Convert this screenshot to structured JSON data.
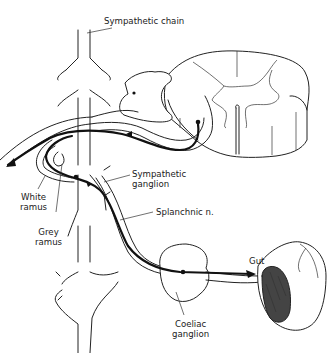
{
  "diagram": {
    "type": "anatomical-illustration",
    "labels": {
      "sympathetic_chain": "Sympathetic chain",
      "sympathetic_ganglion_line1": "Sympathetic",
      "sympathetic_ganglion_line2": "ganglion",
      "white_ramus_line1": "White",
      "white_ramus_line2": "ramus",
      "grey_ramus_line1": "Grey",
      "grey_ramus_line2": "ramus",
      "splanchnic_nerve": "Splanchnic n.",
      "gut": "Gut",
      "coeliac_ganglion_line1": "Coeliac",
      "coeliac_ganglion_line2": "ganglion"
    },
    "structures": [
      "spinal-cord-section",
      "sympathetic-chain",
      "sympathetic-ganglion",
      "white-ramus",
      "grey-ramus",
      "splanchnic-nerve",
      "coeliac-ganglion",
      "gut-section"
    ],
    "colors": {
      "line": "#222222",
      "background": "#ffffff"
    }
  }
}
